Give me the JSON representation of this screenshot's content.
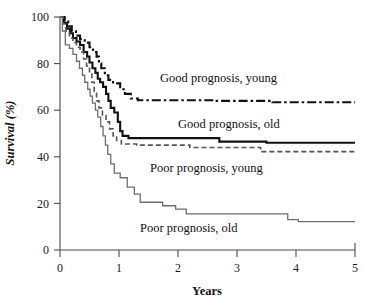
{
  "chart_data": {
    "type": "line",
    "title": "",
    "subtitle": "",
    "xlabel": "Years",
    "ylabel": "Survival (%)",
    "xlim": [
      0,
      5
    ],
    "ylim": [
      0,
      100
    ],
    "xticks": [
      0,
      1,
      2,
      3,
      4,
      5
    ],
    "yticks": [
      0,
      20,
      40,
      60,
      80,
      100
    ],
    "xtick_labels": [
      "0",
      "1",
      "2",
      "3",
      "4",
      "5"
    ],
    "ytick_labels": [
      "0",
      "20",
      "40",
      "60",
      "80",
      "100"
    ],
    "grid": false,
    "legend_position": "inline-annotations",
    "curve_style": "kaplan-meier-step",
    "series": [
      {
        "name": "Good prognosis, young",
        "label": "Good prognosis, young",
        "style": "dash-dot",
        "color": "#111111",
        "width": 2.1,
        "dasharray": "9,3,2.5,3",
        "final_value": 63,
        "points": [
          [
            0.0,
            100
          ],
          [
            0.08,
            100
          ],
          [
            0.08,
            98
          ],
          [
            0.14,
            98
          ],
          [
            0.14,
            96
          ],
          [
            0.2,
            96
          ],
          [
            0.2,
            94
          ],
          [
            0.27,
            94
          ],
          [
            0.27,
            92
          ],
          [
            0.34,
            92
          ],
          [
            0.34,
            90.5
          ],
          [
            0.42,
            90.5
          ],
          [
            0.42,
            89
          ],
          [
            0.5,
            89
          ],
          [
            0.5,
            87
          ],
          [
            0.56,
            87
          ],
          [
            0.56,
            85
          ],
          [
            0.62,
            85
          ],
          [
            0.62,
            83
          ],
          [
            0.66,
            83
          ],
          [
            0.66,
            80
          ],
          [
            0.7,
            80
          ],
          [
            0.7,
            78
          ],
          [
            0.76,
            78
          ],
          [
            0.76,
            75
          ],
          [
            0.82,
            75
          ],
          [
            0.82,
            73
          ],
          [
            0.9,
            73
          ],
          [
            0.9,
            71.5
          ],
          [
            1.02,
            71.5
          ],
          [
            1.02,
            69
          ],
          [
            1.1,
            69
          ],
          [
            1.1,
            67
          ],
          [
            1.2,
            67
          ],
          [
            1.2,
            65
          ],
          [
            1.32,
            65
          ],
          [
            1.32,
            64.3
          ],
          [
            2.6,
            64.3
          ],
          [
            2.6,
            64.0
          ],
          [
            3.6,
            64.0
          ],
          [
            3.6,
            63.4
          ],
          [
            5.0,
            63.4
          ]
        ]
      },
      {
        "name": "Good prognosis, old",
        "label": "Good prognosis, old",
        "style": "solid-thick",
        "color": "#111111",
        "width": 2.1,
        "dasharray": "",
        "final_value": 46,
        "points": [
          [
            0.0,
            100
          ],
          [
            0.06,
            100
          ],
          [
            0.06,
            97.5
          ],
          [
            0.12,
            97.5
          ],
          [
            0.12,
            95
          ],
          [
            0.17,
            95
          ],
          [
            0.17,
            93
          ],
          [
            0.22,
            93
          ],
          [
            0.22,
            91
          ],
          [
            0.28,
            91
          ],
          [
            0.28,
            89.5
          ],
          [
            0.34,
            89.5
          ],
          [
            0.34,
            88
          ],
          [
            0.4,
            88
          ],
          [
            0.4,
            85
          ],
          [
            0.46,
            85
          ],
          [
            0.46,
            83
          ],
          [
            0.5,
            83
          ],
          [
            0.5,
            80.5
          ],
          [
            0.55,
            80.5
          ],
          [
            0.55,
            78
          ],
          [
            0.6,
            78
          ],
          [
            0.6,
            76
          ],
          [
            0.64,
            76
          ],
          [
            0.64,
            73.5
          ],
          [
            0.68,
            73.5
          ],
          [
            0.68,
            72
          ],
          [
            0.73,
            72
          ],
          [
            0.73,
            70
          ],
          [
            0.78,
            70
          ],
          [
            0.78,
            67
          ],
          [
            0.82,
            67
          ],
          [
            0.82,
            64
          ],
          [
            0.86,
            64
          ],
          [
            0.86,
            61
          ],
          [
            0.92,
            61
          ],
          [
            0.92,
            59
          ],
          [
            0.98,
            59
          ],
          [
            0.98,
            55
          ],
          [
            1.02,
            55
          ],
          [
            1.02,
            51
          ],
          [
            1.06,
            51
          ],
          [
            1.06,
            49
          ],
          [
            1.16,
            49
          ],
          [
            1.16,
            48
          ],
          [
            2.7,
            48
          ],
          [
            2.7,
            46.5
          ],
          [
            3.5,
            46.5
          ],
          [
            3.5,
            46.0
          ],
          [
            5.0,
            46.0
          ]
        ]
      },
      {
        "name": "Poor prognosis, young",
        "label": "Poor prognosis, young",
        "style": "dashed",
        "color": "#555555",
        "width": 1.6,
        "dasharray": "5,3",
        "final_value": 42,
        "points": [
          [
            0.0,
            100
          ],
          [
            0.05,
            100
          ],
          [
            0.05,
            97
          ],
          [
            0.1,
            97
          ],
          [
            0.1,
            94
          ],
          [
            0.16,
            94
          ],
          [
            0.16,
            91
          ],
          [
            0.22,
            91
          ],
          [
            0.22,
            89
          ],
          [
            0.28,
            89
          ],
          [
            0.28,
            87
          ],
          [
            0.34,
            87
          ],
          [
            0.34,
            85
          ],
          [
            0.4,
            85
          ],
          [
            0.4,
            82
          ],
          [
            0.45,
            82
          ],
          [
            0.45,
            79
          ],
          [
            0.5,
            79
          ],
          [
            0.5,
            76
          ],
          [
            0.54,
            76
          ],
          [
            0.54,
            72
          ],
          [
            0.58,
            72
          ],
          [
            0.58,
            68
          ],
          [
            0.62,
            68
          ],
          [
            0.62,
            64
          ],
          [
            0.66,
            64
          ],
          [
            0.66,
            61
          ],
          [
            0.72,
            61
          ],
          [
            0.72,
            58
          ],
          [
            0.78,
            58
          ],
          [
            0.78,
            55
          ],
          [
            0.84,
            55
          ],
          [
            0.84,
            52
          ],
          [
            0.9,
            52
          ],
          [
            0.9,
            49
          ],
          [
            0.96,
            49
          ],
          [
            0.96,
            47
          ],
          [
            1.04,
            47
          ],
          [
            1.04,
            45.5
          ],
          [
            1.3,
            45.5
          ],
          [
            1.3,
            45.0
          ],
          [
            2.2,
            45.0
          ],
          [
            2.2,
            44.0
          ],
          [
            3.4,
            44.0
          ],
          [
            3.4,
            42.2
          ],
          [
            5.0,
            42.2
          ]
        ]
      },
      {
        "name": "Poor prognosis, old",
        "label": "Poor prognosis, old",
        "style": "solid-thin",
        "color": "#6e6e6e",
        "width": 1.3,
        "dasharray": "",
        "final_value": 12,
        "points": [
          [
            0.0,
            100
          ],
          [
            0.04,
            100
          ],
          [
            0.04,
            94
          ],
          [
            0.09,
            94
          ],
          [
            0.09,
            88
          ],
          [
            0.16,
            88
          ],
          [
            0.16,
            86.5
          ],
          [
            0.22,
            86.5
          ],
          [
            0.22,
            84
          ],
          [
            0.28,
            84
          ],
          [
            0.28,
            81
          ],
          [
            0.33,
            81
          ],
          [
            0.33,
            78
          ],
          [
            0.38,
            78
          ],
          [
            0.38,
            75
          ],
          [
            0.42,
            75
          ],
          [
            0.42,
            72
          ],
          [
            0.47,
            72
          ],
          [
            0.47,
            69
          ],
          [
            0.51,
            69
          ],
          [
            0.51,
            66
          ],
          [
            0.55,
            66
          ],
          [
            0.55,
            63
          ],
          [
            0.6,
            63
          ],
          [
            0.6,
            60
          ],
          [
            0.64,
            60
          ],
          [
            0.64,
            57
          ],
          [
            0.69,
            57
          ],
          [
            0.69,
            53
          ],
          [
            0.73,
            53
          ],
          [
            0.73,
            49
          ],
          [
            0.77,
            49
          ],
          [
            0.77,
            45
          ],
          [
            0.81,
            45
          ],
          [
            0.81,
            41
          ],
          [
            0.86,
            41
          ],
          [
            0.86,
            37
          ],
          [
            0.92,
            37
          ],
          [
            0.92,
            33
          ],
          [
            1.02,
            33
          ],
          [
            1.02,
            31
          ],
          [
            1.14,
            31
          ],
          [
            1.14,
            27
          ],
          [
            1.26,
            27
          ],
          [
            1.26,
            24
          ],
          [
            1.36,
            24
          ],
          [
            1.36,
            20.5
          ],
          [
            1.74,
            20.5
          ],
          [
            1.74,
            19
          ],
          [
            1.96,
            19
          ],
          [
            1.96,
            17.5
          ],
          [
            2.14,
            17.5
          ],
          [
            2.14,
            15.5
          ],
          [
            3.86,
            15.5
          ],
          [
            3.86,
            13
          ],
          [
            4.04,
            13
          ],
          [
            4.04,
            12.2
          ],
          [
            5.0,
            12.2
          ]
        ]
      }
    ],
    "annotations": [
      {
        "text": "Good prognosis, young",
        "x_px": 160,
        "y_px": 82,
        "anchor": "start"
      },
      {
        "text": "Good prognosis, old",
        "x_px": 178,
        "y_px": 128,
        "anchor": "start"
      },
      {
        "text": "Poor prognosis, young",
        "x_px": 150,
        "y_px": 172,
        "anchor": "start"
      },
      {
        "text": "Poor prognosis, old",
        "x_px": 140,
        "y_px": 232,
        "anchor": "start"
      }
    ]
  },
  "axes": {
    "x_label": "Years",
    "y_label": "Survival (%)"
  }
}
